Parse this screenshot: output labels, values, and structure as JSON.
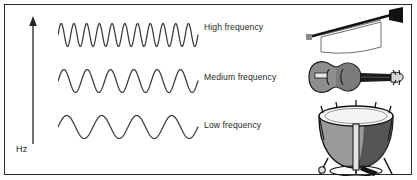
{
  "diagram": {
    "background_color": "#ffffff",
    "border_color": "#2b2b2b",
    "wave_color": "#3a3a3a",
    "text_color": "#1f1f1f"
  },
  "axis": {
    "label": "Hz",
    "direction": "up",
    "name": "frequency-axis"
  },
  "rows": [
    {
      "id": "high",
      "label": "High frequency",
      "cycles": 11,
      "instrument": "trumpet"
    },
    {
      "id": "medium",
      "label": "Medium frequency",
      "cycles": 6,
      "instrument": "violin"
    },
    {
      "id": "low",
      "label": "Low frequency",
      "cycles": 4,
      "instrument": "timpani-drum"
    }
  ],
  "instruments": {
    "trumpet": "herald-trumpet-with-banner",
    "violin": "violin",
    "drum": "timpani-drum"
  },
  "chart_data": {
    "type": "line",
    "xlabel": "",
    "ylabel": "Hz",
    "grid": false,
    "legend": "right",
    "series": [
      {
        "name": "High frequency",
        "cycles": 11,
        "amplitude": 11,
        "instrument": "trumpet"
      },
      {
        "name": "Medium frequency",
        "cycles": 6,
        "amplitude": 11,
        "instrument": "violin"
      },
      {
        "name": "Low frequency",
        "cycles": 4,
        "amplitude": 11,
        "instrument": "timpani-drum"
      }
    ]
  }
}
